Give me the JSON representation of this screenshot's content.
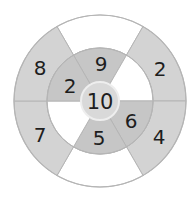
{
  "diagram": {
    "type": "number-wheel",
    "colors": {
      "outer_shaded": "#d3d3d3",
      "inner_shaded": "#c6c6c6",
      "center_fill": "#d9d9d9",
      "blank": "#ffffff",
      "stroke": "#b5b5b5",
      "text": "#1e1e1e"
    },
    "center": {
      "value": "10"
    },
    "inner_ring": [
      {
        "position": "top",
        "value": "9",
        "shaded": true
      },
      {
        "position": "top-right",
        "value": "",
        "shaded": false
      },
      {
        "position": "bottom-right",
        "value": "6",
        "shaded": true
      },
      {
        "position": "bottom",
        "value": "5",
        "shaded": true
      },
      {
        "position": "bottom-left",
        "value": "",
        "shaded": false
      },
      {
        "position": "top-left",
        "value": "2",
        "shaded": true
      }
    ],
    "outer_ring": [
      {
        "position": "top",
        "value": "",
        "shaded": false
      },
      {
        "position": "top-right",
        "value": "2",
        "shaded": true
      },
      {
        "position": "bottom-right",
        "value": "4",
        "shaded": true
      },
      {
        "position": "bottom",
        "value": "",
        "shaded": false
      },
      {
        "position": "bottom-left",
        "value": "7",
        "shaded": true
      },
      {
        "position": "top-left",
        "value": "8",
        "shaded": true
      }
    ]
  }
}
